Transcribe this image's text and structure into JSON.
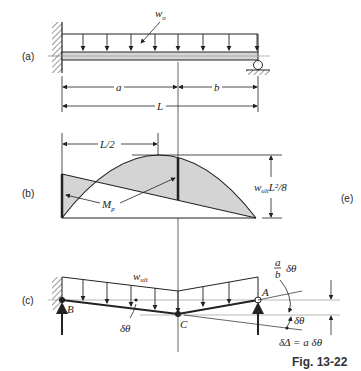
{
  "figure": {
    "caption": "Fig. 13-22",
    "panels": {
      "a": {
        "label": "(a)",
        "load_label": "w",
        "load_subscript": "o",
        "dim_a": "a",
        "dim_b": "b",
        "dim_L": "L"
      },
      "b": {
        "label": "(b)",
        "half_span": "L/2",
        "moment_label": "M",
        "moment_subscript": "p",
        "max_moment_w": "w",
        "max_moment_sub": "ult",
        "max_moment_rest": "L²/8"
      },
      "e_label": "(e)",
      "c": {
        "label": "(c)",
        "load_label": "w",
        "load_subscript": "ult",
        "point_B": "B",
        "point_C": "C",
        "point_A": "A",
        "rotation_left": "δθ",
        "ratio_num": "a",
        "ratio_den": "b",
        "ratio_rot": "δθ",
        "rotation_right": "δθ",
        "deflection": "δΔ = a δθ"
      }
    }
  }
}
